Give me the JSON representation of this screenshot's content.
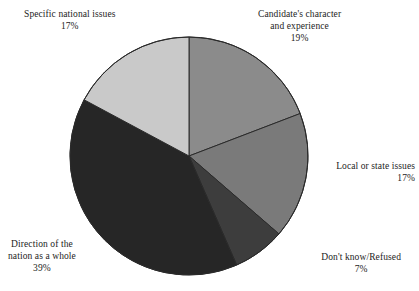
{
  "chart_data": {
    "type": "pie",
    "title": "",
    "subtitle": "",
    "xlabel": "",
    "ylabel": "",
    "grid": false,
    "legend_position": "none",
    "units": "percent",
    "start_angle_deg": 0,
    "direction": "clockwise",
    "categories": [
      "Candidate's character and experience",
      "Local or state issues",
      "Don't know/Refused",
      "Direction of the nation as a whole",
      "Specific national issues"
    ],
    "values": [
      19,
      17,
      7,
      39,
      17
    ],
    "value_labels": [
      "19%",
      "17%",
      "7%",
      "39%",
      "17%"
    ],
    "colors": [
      "#8b8b8b",
      "#7a7a7a",
      "#3d3d3d",
      "#262626",
      "#c9c9c9"
    ],
    "slices": [
      {
        "name": "candidates-character-and-experience",
        "label_line1": "Candidate's character",
        "label_line2": "and experience",
        "value": 19,
        "value_label": "19%",
        "color": "#8b8b8b"
      },
      {
        "name": "local-or-state-issues",
        "label_line1": "Local or state issues",
        "label_line2": "",
        "value": 17,
        "value_label": "17%",
        "color": "#7a7a7a"
      },
      {
        "name": "dont-know-refused",
        "label_line1": "Don't know/Refused",
        "label_line2": "",
        "value": 7,
        "value_label": "7%",
        "color": "#3d3d3d"
      },
      {
        "name": "direction-of-the-nation-as-a-whole",
        "label_line1": "Direction of the",
        "label_line2": "nation as a whole",
        "value": 39,
        "value_label": "39%",
        "color": "#262626"
      },
      {
        "name": "specific-national-issues",
        "label_line1": "Specific national issues",
        "label_line2": "",
        "value": 17,
        "value_label": "17%",
        "color": "#c9c9c9"
      }
    ],
    "geometry": {
      "center_x": 189,
      "center_y": 156,
      "radius": 119,
      "stroke_color": "#2a2a2a",
      "background": "#ffffff"
    }
  }
}
